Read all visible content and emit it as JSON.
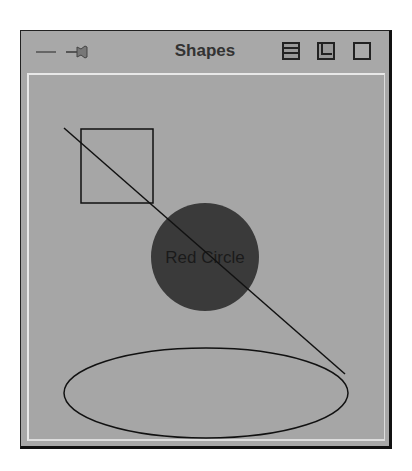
{
  "window": {
    "title": "Shapes",
    "left_icons": [
      "window-menu-icon",
      "pin-icon"
    ],
    "right_icons": [
      "shade-icon",
      "minimize-icon",
      "maximize-icon"
    ]
  },
  "canvas": {
    "background": "#a6a6a6",
    "shapes": [
      {
        "type": "rectangle",
        "x": 80,
        "y": 128,
        "width": 72,
        "height": 74,
        "stroke": "#111111"
      },
      {
        "type": "circle",
        "cx": 204,
        "cy": 256,
        "r": 54,
        "fill": "#3a3a3a",
        "label": "Red Circle"
      },
      {
        "type": "line",
        "x1": 63,
        "y1": 127,
        "x2": 344,
        "y2": 373,
        "stroke": "#111111"
      },
      {
        "type": "ellipse",
        "cx": 205,
        "cy": 392,
        "rx": 142,
        "ry": 45,
        "stroke": "#111111"
      }
    ]
  }
}
